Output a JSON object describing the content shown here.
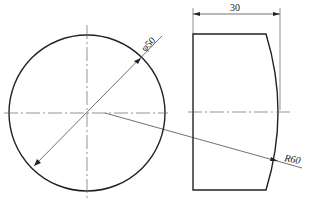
{
  "diagram": {
    "type": "engineering-drawing",
    "views": [
      "front-view-circle",
      "side-view-profile"
    ],
    "dimensions": {
      "diameter": "φ50",
      "width": "30",
      "radius": "R60"
    },
    "colors": {
      "line": "#222222",
      "centerline": "#555555"
    }
  }
}
